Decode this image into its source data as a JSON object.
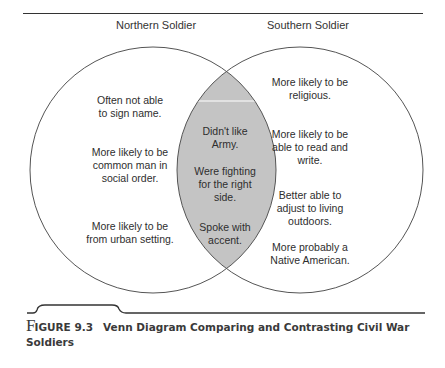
{
  "diagram": {
    "type": "venn",
    "sets": [
      {
        "id": "north",
        "label": "Northern Soldier",
        "items": [
          "Often not able\nto sign name.",
          "More likely to be\ncommon man in\nsocial order.",
          "More likely to be\nfrom urban setting."
        ]
      },
      {
        "id": "south",
        "label": "Southern Soldier",
        "items": [
          "More likely to be\nreligious.",
          "More likely to be\nable to read and\nwrite.",
          "Better able to\nadjust to living\noutdoors.",
          "More probably a\nNative American."
        ]
      }
    ],
    "overlap": {
      "items": [
        "Didn't like\nArmy.",
        "Were fighting\nfor the right\nside.",
        "Spoke with\naccent."
      ],
      "fill_color": "#c4c4c4"
    },
    "stroke_color": "#555555"
  },
  "caption": {
    "initial": "F",
    "figure_number": "IGURE 9.3",
    "title": "Venn Diagram Comparing and Contrasting Civil War Soldiers"
  }
}
